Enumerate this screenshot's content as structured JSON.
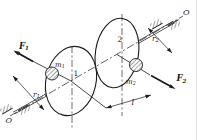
{
  "figure": {
    "kind": "mechanics-diagram-shaft-with-two-disks",
    "colors": {
      "ink": "#1c1c1c",
      "paper": "#ffffff"
    },
    "labels": {
      "axis_end_bottom": "O",
      "axis_end_top": "O",
      "force1": {
        "base": "F",
        "sub": "1"
      },
      "force2": {
        "base": "F",
        "sub": "2"
      },
      "mass1": {
        "base": "m",
        "sub": "1"
      },
      "mass2": {
        "base": "m",
        "sub": "2"
      },
      "radius1": {
        "base": "r",
        "sub": "1"
      },
      "radius2": {
        "base": "r",
        "sub": "2"
      },
      "disk1": "1",
      "disk2": "2",
      "length": "l"
    }
  }
}
